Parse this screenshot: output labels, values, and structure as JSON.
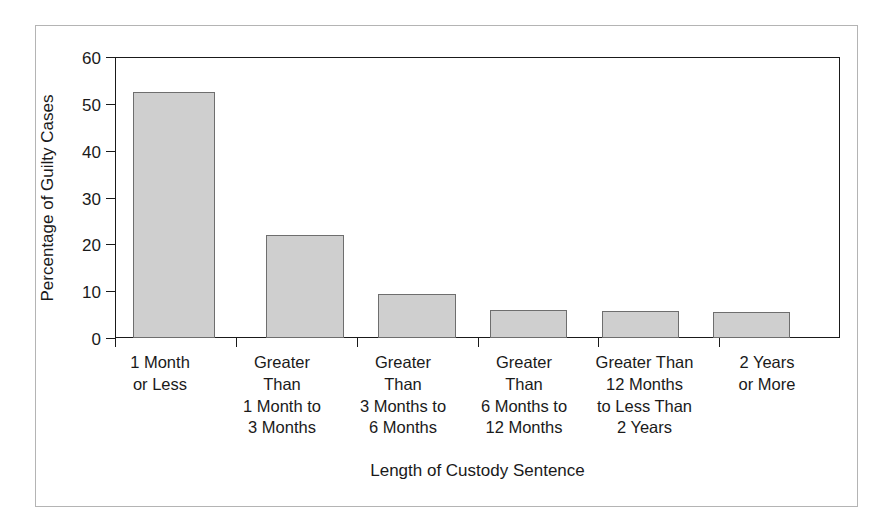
{
  "chart_data": {
    "type": "bar",
    "title": "",
    "xlabel": "Length of Custody Sentence",
    "ylabel": "Percentage of Guilty Cases",
    "ylim": [
      0,
      60
    ],
    "yticks": [
      0,
      10,
      20,
      30,
      40,
      50,
      60
    ],
    "ytick_labels": [
      "0",
      "10",
      "20",
      "30",
      "40",
      "50",
      "60"
    ],
    "grid": false,
    "legend": null,
    "bar_color": "#cfcfcf",
    "bar_edge_color": "#6e6e6e",
    "axis_color": "#1a1a1a",
    "background_color": "#ffffff",
    "frame_color": "#b4b4b4",
    "categories": [
      "1 Month or Less",
      "Greater Than 1 Month to 3 Months",
      "Greater Than 3 Months to 6 Months",
      "Greater Than 6 Months to 12 Months",
      "Greater Than 12 Months to Less Than 2 Years",
      "2 Years or More"
    ],
    "category_label_lines": [
      [
        "1 Month",
        "or Less"
      ],
      [
        "Greater",
        "Than",
        "1 Month to",
        "3 Months"
      ],
      [
        "Greater",
        "Than",
        "3 Months to",
        "6 Months"
      ],
      [
        "Greater",
        "Than",
        "6 Months to",
        "12 Months"
      ],
      [
        "Greater Than",
        "12 Months",
        "to Less Than",
        "2 Years"
      ],
      [
        "2 Years",
        "or More"
      ]
    ],
    "values": [
      52.6,
      21.9,
      9.4,
      6.0,
      5.8,
      5.6
    ]
  }
}
